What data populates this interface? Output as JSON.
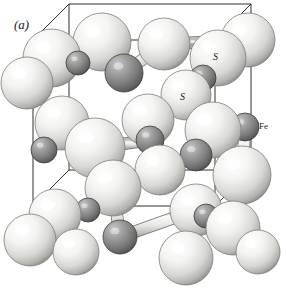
{
  "figure": {
    "panel_label": "(a)",
    "background_color": "#ffffff",
    "width": 287,
    "height": 294
  },
  "labels": [
    {
      "name": "panel-label",
      "text": "(a)",
      "x": 14,
      "y": 18,
      "style": "lbl-panel"
    },
    {
      "name": "sulfur-label-upper",
      "text": "S",
      "x": 213,
      "y": 52,
      "style": "lbl-atom"
    },
    {
      "name": "sulfur-label-lower",
      "text": "S",
      "x": 180,
      "y": 92,
      "style": "lbl-atom"
    },
    {
      "name": "iron-label",
      "text": "Fe",
      "x": 259,
      "y": 122,
      "style": "lbl-plain"
    }
  ],
  "legend": {
    "sulfur_symbol": "S",
    "iron_symbol": "Fe",
    "sulfur_color": "#f2f2f0",
    "iron_color": "#808080",
    "bond_color": "#e2e2e0",
    "cell_edge_color": "#1a1a1a"
  },
  "unit_cell": {
    "edge_stroke_width": 0.9,
    "front_face": [
      [
        33,
        206
      ],
      [
        215,
        206
      ],
      [
        215,
        40
      ],
      [
        33,
        40
      ]
    ],
    "back_offset": [
      36,
      -36
    ]
  },
  "atoms": [
    {
      "id": "S1",
      "element": "S",
      "x": 102,
      "y": 42,
      "r": 29
    },
    {
      "id": "S2",
      "element": "S",
      "x": 52,
      "y": 58,
      "r": 29
    },
    {
      "id": "S3",
      "element": "S",
      "x": 164,
      "y": 44,
      "r": 26
    },
    {
      "id": "S4",
      "element": "S",
      "x": 248,
      "y": 40,
      "r": 27
    },
    {
      "id": "S5",
      "element": "S",
      "x": 218,
      "y": 58,
      "r": 28
    },
    {
      "id": "S6",
      "element": "S",
      "x": 27,
      "y": 83,
      "r": 26
    },
    {
      "id": "S7",
      "element": "S",
      "x": 186,
      "y": 95,
      "r": 25
    },
    {
      "id": "S8",
      "element": "S",
      "x": 62,
      "y": 123,
      "r": 27
    },
    {
      "id": "S9",
      "element": "S",
      "x": 148,
      "y": 120,
      "r": 26
    },
    {
      "id": "S10",
      "element": "S",
      "x": 213,
      "y": 130,
      "r": 28
    },
    {
      "id": "S11",
      "element": "S",
      "x": 95,
      "y": 148,
      "r": 30
    },
    {
      "id": "S12",
      "element": "S",
      "x": 160,
      "y": 170,
      "r": 25
    },
    {
      "id": "S13",
      "element": "S",
      "x": 242,
      "y": 175,
      "r": 29
    },
    {
      "id": "S14",
      "element": "S",
      "x": 113,
      "y": 188,
      "r": 28
    },
    {
      "id": "S15",
      "element": "S",
      "x": 196,
      "y": 210,
      "r": 26
    },
    {
      "id": "S16",
      "element": "S",
      "x": 55,
      "y": 215,
      "r": 26
    },
    {
      "id": "S17",
      "element": "S",
      "x": 30,
      "y": 240,
      "r": 26
    },
    {
      "id": "S18",
      "element": "S",
      "x": 233,
      "y": 228,
      "r": 27
    },
    {
      "id": "S19",
      "element": "S",
      "x": 186,
      "y": 258,
      "r": 27
    },
    {
      "id": "S20",
      "element": "S",
      "x": 76,
      "y": 252,
      "r": 23
    },
    {
      "id": "S21",
      "element": "S",
      "x": 258,
      "y": 252,
      "r": 22
    },
    {
      "id": "Fe1",
      "element": "Fe",
      "x": 124,
      "y": 73,
      "r": 19
    },
    {
      "id": "Fe2",
      "element": "Fe",
      "x": 203,
      "y": 78,
      "r": 13
    },
    {
      "id": "Fe3",
      "element": "Fe",
      "x": 245,
      "y": 127,
      "r": 14
    },
    {
      "id": "Fe4",
      "element": "Fe",
      "x": 44,
      "y": 150,
      "r": 13
    },
    {
      "id": "Fe5",
      "element": "Fe",
      "x": 150,
      "y": 140,
      "r": 14
    },
    {
      "id": "Fe6",
      "element": "Fe",
      "x": 196,
      "y": 155,
      "r": 16
    },
    {
      "id": "Fe7",
      "element": "Fe",
      "x": 120,
      "y": 237,
      "r": 17
    },
    {
      "id": "Fe8",
      "element": "Fe",
      "x": 78,
      "y": 63,
      "r": 12
    },
    {
      "id": "Fe9",
      "element": "Fe",
      "x": 36,
      "y": 72,
      "r": 11
    },
    {
      "id": "Fe10",
      "element": "Fe",
      "x": 206,
      "y": 216,
      "r": 12
    },
    {
      "id": "Fe11",
      "element": "Fe",
      "x": 88,
      "y": 210,
      "r": 12
    }
  ],
  "bonds": [
    {
      "a": "S2",
      "b": "Fe8"
    },
    {
      "a": "S1",
      "b": "Fe1"
    },
    {
      "a": "Fe1",
      "b": "S3"
    },
    {
      "a": "S3",
      "b": "S4"
    },
    {
      "a": "S5",
      "b": "Fe2"
    },
    {
      "a": "Fe2",
      "b": "S7"
    },
    {
      "a": "S7",
      "b": "S9"
    },
    {
      "a": "S9",
      "b": "Fe5"
    },
    {
      "a": "Fe5",
      "b": "S11"
    },
    {
      "a": "S11",
      "b": "S8"
    },
    {
      "a": "S10",
      "b": "Fe6"
    },
    {
      "a": "Fe6",
      "b": "S12"
    },
    {
      "a": "S12",
      "b": "S14"
    },
    {
      "a": "S13",
      "b": "Fe3"
    },
    {
      "a": "S16",
      "b": "Fe11"
    },
    {
      "a": "Fe11",
      "b": "S14"
    },
    {
      "a": "S14",
      "b": "Fe7"
    },
    {
      "a": "Fe7",
      "b": "S15"
    },
    {
      "a": "S18",
      "b": "Fe10"
    },
    {
      "a": "S6",
      "b": "Fe9"
    },
    {
      "a": "S19",
      "b": "S15"
    },
    {
      "a": "S21",
      "b": "S18"
    }
  ]
}
